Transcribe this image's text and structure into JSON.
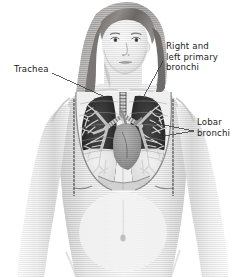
{
  "figure": {
    "style": "grayscale halftone medical illustration",
    "width": 247,
    "height": 277,
    "background_color": "#ffffff",
    "ink_color": "#1b1b1b",
    "leader_line_color": "#3a3a3a"
  },
  "labels": [
    {
      "id": "trachea",
      "name": "Trachea",
      "lines": [
        "Trachea"
      ],
      "text_x": 14,
      "text_y": 64,
      "align": "left",
      "leaders": [
        {
          "x1": 52,
          "y1": 73,
          "x2": 105,
          "y2": 97
        }
      ]
    },
    {
      "id": "primary-bronchi",
      "name": "Right and left primary bronchi",
      "lines": [
        "Right and",
        "left primary",
        "bronchi"
      ],
      "text_x": 166,
      "text_y": 41,
      "align": "left",
      "leaders": [
        {
          "x1": 163,
          "y1": 61,
          "x2": 139,
          "y2": 105
        }
      ]
    },
    {
      "id": "lobar-bronchi",
      "name": "Lobar bronchi",
      "lines": [
        "Lobar",
        "bronchi"
      ],
      "text_x": 197,
      "text_y": 117,
      "align": "left",
      "leaders": [
        {
          "x1": 194,
          "y1": 131,
          "x2": 149,
          "y2": 122
        },
        {
          "x1": 194,
          "y1": 131,
          "x2": 146,
          "y2": 139
        }
      ]
    }
  ],
  "anatomy": {
    "regions": [
      {
        "id": "head",
        "name": "Head and face"
      },
      {
        "id": "hair",
        "name": "Long hair"
      },
      {
        "id": "neck",
        "name": "Neck"
      },
      {
        "id": "shoulders",
        "name": "Shoulders"
      },
      {
        "id": "arms",
        "name": "Arms"
      },
      {
        "id": "torso",
        "name": "Torso and abdomen"
      },
      {
        "id": "navel",
        "name": "Navel"
      },
      {
        "id": "right-lung",
        "name": "Right lung"
      },
      {
        "id": "left-lung",
        "name": "Left lung"
      },
      {
        "id": "trachea",
        "name": "Trachea"
      },
      {
        "id": "primary-bronchi",
        "name": "Primary bronchi"
      },
      {
        "id": "lobar-bronchi",
        "name": "Lobar bronchi"
      },
      {
        "id": "bronchial-tree",
        "name": "Bronchial tree branches"
      },
      {
        "id": "heart",
        "name": "Heart"
      },
      {
        "id": "ribcage",
        "name": "Rib cage outline"
      },
      {
        "id": "diaphragm",
        "name": "Diaphragm"
      }
    ]
  }
}
